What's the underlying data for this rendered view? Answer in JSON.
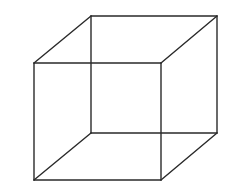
{
  "diagram": {
    "title": "",
    "type": "wireframe-cube",
    "stroke_color": "#2a2a2a",
    "background_color": "#ffffff",
    "front_face": {
      "x1": 34,
      "y1": 63,
      "x2": 161,
      "y2": 180
    },
    "back_face": {
      "x1": 91,
      "y1": 16,
      "x2": 217,
      "y2": 133
    }
  }
}
